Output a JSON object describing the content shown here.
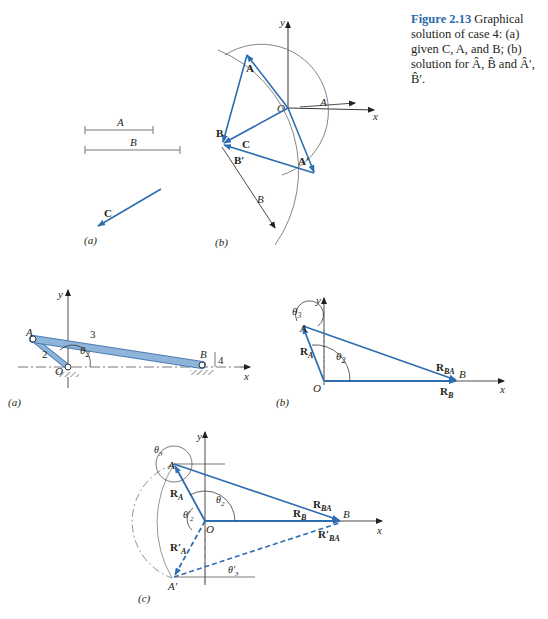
{
  "caption": {
    "figure_label": "Figure 2.13",
    "text": " Graphical solution of case 4: (a) given C, A, and B; (b) solution for Â, B̂ and Â′, B̂′."
  },
  "top": {
    "panel_a": {
      "label": "(a)",
      "seg_A": "A",
      "seg_B": "B",
      "vec_C": "C"
    },
    "panel_b": {
      "label": "(b)",
      "y": "y",
      "x": "x",
      "O": "O",
      "A_len": "A",
      "B_len": "B",
      "vA": "A",
      "vB": "B",
      "vC": "C",
      "vAp": "A′",
      "vBp": "B′"
    }
  },
  "middle": {
    "panel_a": {
      "label": "(a)",
      "A": "A",
      "B": "B",
      "O": "O",
      "y": "y",
      "x": "x",
      "link2": "2",
      "link3": "3",
      "link4": "4",
      "theta2": "θ",
      "theta2_sub": "2"
    },
    "panel_b": {
      "label": "(b)",
      "A": "A",
      "B": "B",
      "O": "O",
      "y": "y",
      "x": "x",
      "RA": "R",
      "RA_sub": "A",
      "RBA": "R",
      "RBA_sub": "BA",
      "RB": "R",
      "RB_sub": "B",
      "theta3": "θ",
      "theta3_sub": "3",
      "theta2": "θ",
      "theta2_sub": "2"
    }
  },
  "bottom": {
    "panel_c": {
      "label": "(c)",
      "A": "A",
      "Ap": "A′",
      "B": "B",
      "O": "O",
      "y": "y",
      "x": "x",
      "RA": "R",
      "RA_sub": "A",
      "RAp": "R′",
      "RAp_sub": "A",
      "RBA": "R",
      "RBA_sub": "BA",
      "RBAp": "R′",
      "RBAp_sub": "BA",
      "RB": "R",
      "RB_sub": "B",
      "theta3": "θ",
      "theta3_sub": "3",
      "theta2": "θ",
      "theta2_sub": "2",
      "theta2p": "θ′",
      "theta2p_sub": "2",
      "theta3p": "θ′",
      "theta3p_sub": "3"
    }
  },
  "colors": {
    "vector_blue": "#2e6eb0",
    "link_fill": "#8fb4d9",
    "line_gray": "#555555"
  }
}
